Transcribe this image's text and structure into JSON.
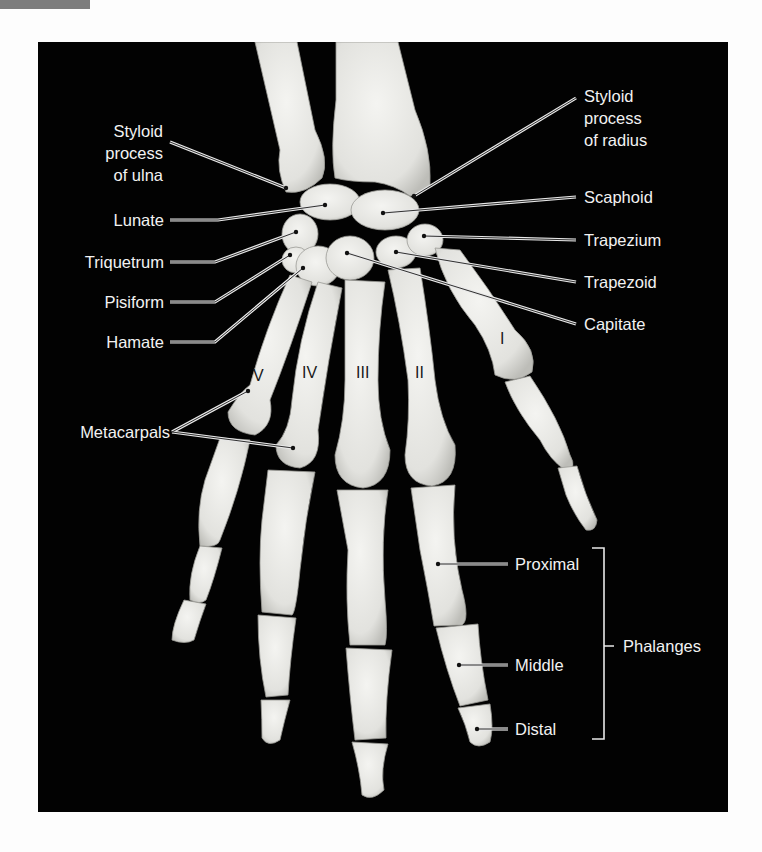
{
  "figure": {
    "colors": {
      "background": "#020202",
      "bone": "#e9e9e6",
      "text": "#f2f2f2",
      "numeral": "#1a1a1a",
      "tab": "#7d7d7d"
    }
  },
  "labels_left": {
    "styloid_ulna": [
      "Styloid",
      "process",
      "of ulna"
    ],
    "lunate": "Lunate",
    "triquetrum": "Triquetrum",
    "pisiform": "Pisiform",
    "hamate": "Hamate",
    "metacarpals": "Metacarpals"
  },
  "labels_right": {
    "styloid_radius": [
      "Styloid",
      "process",
      "of radius"
    ],
    "scaphoid": "Scaphoid",
    "trapezium": "Trapezium",
    "trapezoid": "Trapezoid",
    "capitate": "Capitate"
  },
  "phalanges": {
    "proximal": "Proximal",
    "middle": "Middle",
    "distal": "Distal",
    "group_label": "Phalanges"
  },
  "metacarpal_numerals": [
    "I",
    "II",
    "III",
    "IV",
    "V"
  ]
}
